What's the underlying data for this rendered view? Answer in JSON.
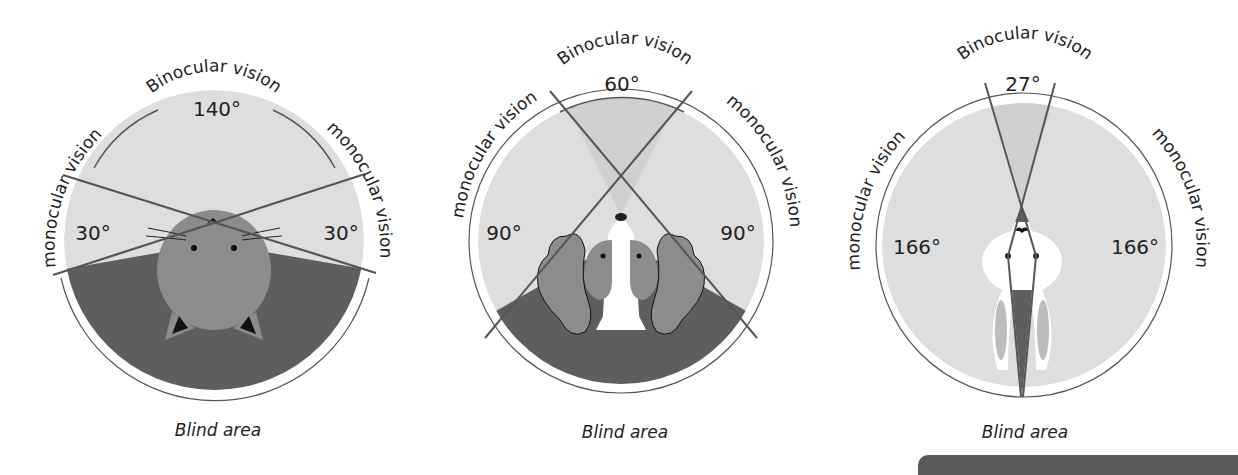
{
  "colors": {
    "monocular_fill": "#dedede",
    "binocular_fill": "#d0d0d0",
    "blind_fill": "#5e5e5e",
    "animal_fill": "#8c8c8c",
    "line": "#555555",
    "text": "#222222"
  },
  "panels": [
    {
      "animal": "cat",
      "top_label": "Binocular vision",
      "binocular_angle": "140°",
      "left_label": "monocular vision",
      "right_label": "monocular vision",
      "left_angle": "30°",
      "right_angle": "30°",
      "bottom_label": "Blind area"
    },
    {
      "animal": "horse",
      "top_label": "Binocular vision",
      "binocular_angle": "60°",
      "left_label": "monocular vision",
      "right_label": "monocular vision",
      "left_angle": "90°",
      "right_angle": "90°",
      "bottom_label": "Blind area"
    },
    {
      "animal": "rabbit",
      "top_label": "Binocular vision",
      "binocular_angle": "27°",
      "left_label": "monocular vision",
      "right_label": "monocular vision",
      "left_angle": "166°",
      "right_angle": "166°",
      "bottom_label": "Blind area"
    }
  ]
}
